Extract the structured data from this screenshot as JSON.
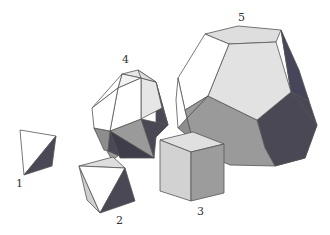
{
  "figure": {
    "solids": [
      {
        "id": 1,
        "label": "1",
        "name": "tetrahedron"
      },
      {
        "id": 2,
        "label": "2",
        "name": "octahedron"
      },
      {
        "id": 3,
        "label": "3",
        "name": "cube"
      },
      {
        "id": 4,
        "label": "4",
        "name": "icosahedron"
      },
      {
        "id": 5,
        "label": "5",
        "name": "dodecahedron"
      }
    ],
    "colors": {
      "white_face": "#ffffff",
      "light_face": "#dcdcdc",
      "mid_face": "#9a9a9a",
      "dark_face": "#4a4854",
      "edge": "#555555"
    }
  }
}
